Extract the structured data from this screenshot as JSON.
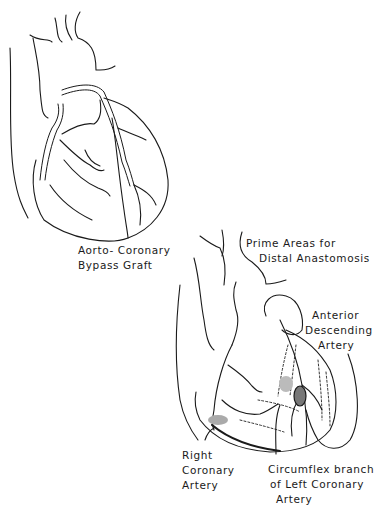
{
  "figure": {
    "top_panel": {
      "caption": [
        "Aorto- Coronary",
        "Bypass Graft"
      ]
    },
    "bottom_panel": {
      "title": [
        "Prime Areas for",
        "Distal Anastomosis"
      ],
      "labels": {
        "anterior_descending": [
          "Anterior",
          "Descending",
          "Artery"
        ],
        "right_coronary": [
          "Right",
          "Coronary",
          "Artery"
        ],
        "circumflex": [
          "Circumflex branch",
          "of Left Coronary",
          "Artery"
        ]
      }
    },
    "colors": {
      "ink": "#1a1a1a",
      "background": "#ffffff"
    }
  }
}
